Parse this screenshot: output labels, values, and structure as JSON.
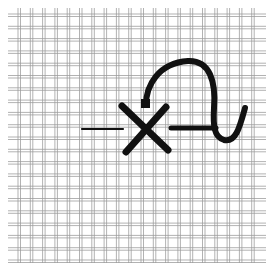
{
  "figure": {
    "title": "",
    "colors": {
      "background": "#ffffff",
      "thread": "#9a9a9a",
      "stitch": "#111111"
    },
    "canvas": {
      "x_start": 8,
      "x_end": 266,
      "y_start": 8,
      "y_end": 263,
      "spacing": 12.3,
      "pair_gap": 2.5
    },
    "stitches": [
      {
        "name": "lead-in-thread",
        "type": "line",
        "from": [
          82,
          129
        ],
        "to": [
          123,
          129
        ],
        "width": 2.2
      },
      {
        "name": "x-stroke-1",
        "type": "line",
        "from": [
          122,
          106
        ],
        "to": [
          168,
          150
        ],
        "width": 7
      },
      {
        "name": "x-stroke-2",
        "type": "line",
        "from": [
          166,
          107
        ],
        "to": [
          126,
          152
        ],
        "width": 7
      },
      {
        "name": "thread-bar",
        "type": "line",
        "from": [
          171,
          128
        ],
        "to": [
          216,
          128
        ],
        "width": 5
      },
      {
        "name": "arc-loop",
        "type": "path",
        "d": "M146,105 C146,86 158,63 188,61 C210,60 216,82 214,108 C213,126 214,137 224,140 C236,143 240,126 245,108",
        "width": 6
      },
      {
        "name": "needle-entry",
        "type": "rect",
        "x": 141,
        "y": 99,
        "w": 9,
        "h": 9
      }
    ]
  }
}
